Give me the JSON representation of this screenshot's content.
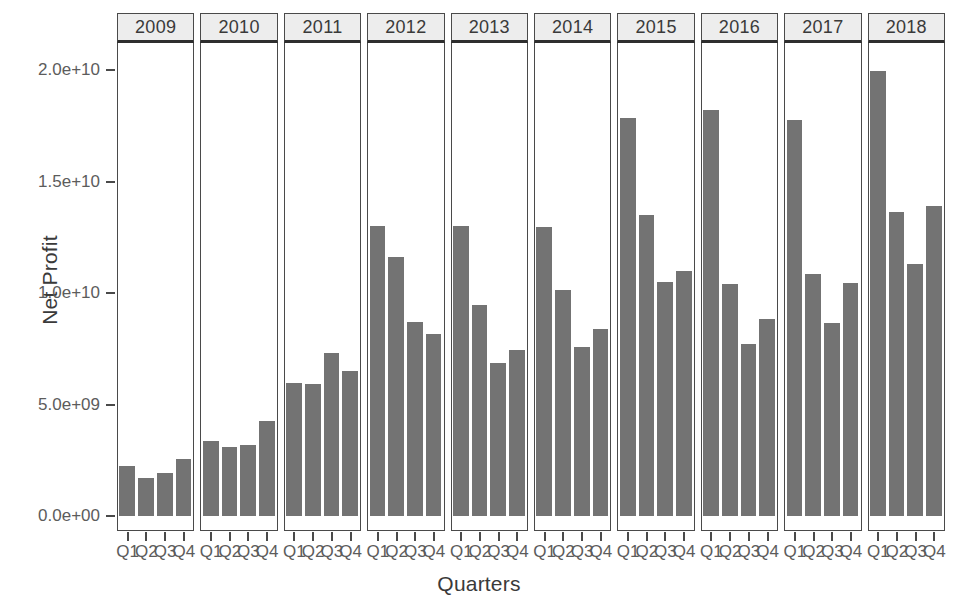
{
  "chart_data": {
    "type": "bar",
    "title": "",
    "xlabel": "Quarters",
    "ylabel": "Net Profit",
    "ylim": [
      0,
      21000000000
    ],
    "grid": false,
    "legend": "none",
    "facet_variable": "Year",
    "categories": [
      "Q1",
      "Q2",
      "Q3",
      "Q4"
    ],
    "ytick_labels": [
      "0.0e+00",
      "5.0e+09",
      "1.0e+10",
      "1.5e+10",
      "2.0e+10"
    ],
    "ytick_values": [
      0,
      5000000000,
      10000000000,
      15000000000,
      20000000000
    ],
    "panels": [
      {
        "label": "2009",
        "values": [
          2250000000,
          1700000000,
          1950000000,
          2550000000
        ]
      },
      {
        "label": "2010",
        "values": [
          3350000000,
          3100000000,
          3200000000,
          4250000000
        ]
      },
      {
        "label": "2011",
        "values": [
          5950000000,
          5900000000,
          7300000000,
          6500000000
        ]
      },
      {
        "label": "2012",
        "values": [
          13000000000,
          11600000000,
          8700000000,
          8150000000
        ]
      },
      {
        "label": "2013",
        "values": [
          13000000000,
          9450000000,
          6850000000,
          7450000000
        ]
      },
      {
        "label": "2014",
        "values": [
          12950000000,
          10150000000,
          7600000000,
          8400000000
        ]
      },
      {
        "label": "2015",
        "values": [
          17850000000,
          13500000000,
          10500000000,
          11000000000
        ]
      },
      {
        "label": "2016",
        "values": [
          18200000000,
          10400000000,
          7700000000,
          8850000000
        ]
      },
      {
        "label": "2017",
        "values": [
          17750000000,
          10850000000,
          8650000000,
          10450000000
        ]
      },
      {
        "label": "2018",
        "values": [
          19950000000,
          13650000000,
          11300000000,
          13900000000
        ]
      }
    ],
    "colors": {
      "bar_fill": "#737373",
      "panel_header_fill": "#ededed",
      "panel_border": "#4a4a4a",
      "text": "#4d4d4d",
      "background": "#ffffff"
    }
  }
}
